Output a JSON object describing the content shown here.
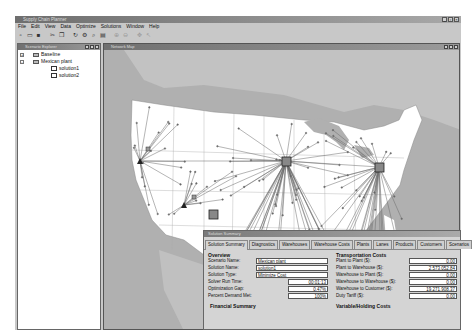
{
  "app": {
    "title": "Supply Chain Planner",
    "window_controls": [
      "minimize",
      "maximize",
      "close"
    ]
  },
  "menu": [
    "File",
    "Edit",
    "View",
    "Data",
    "Optimize",
    "Solutions",
    "Window",
    "Help"
  ],
  "toolbar": {
    "tools": [
      {
        "icon": "new-icon",
        "glyph": "▫"
      },
      {
        "icon": "open-icon",
        "glyph": "▭"
      },
      {
        "icon": "save-icon",
        "glyph": "■"
      },
      {
        "icon": "sep"
      },
      {
        "icon": "cut-icon",
        "glyph": "✂"
      },
      {
        "icon": "copy-icon",
        "glyph": "❐"
      },
      {
        "icon": "sep"
      },
      {
        "icon": "refresh-icon",
        "glyph": "↻"
      },
      {
        "icon": "optimize-icon",
        "glyph": "⚙"
      },
      {
        "icon": "zoom-icon",
        "glyph": "⌕"
      },
      {
        "icon": "report-icon",
        "glyph": "▤"
      },
      {
        "icon": "sep"
      },
      {
        "icon": "zoom-in-icon",
        "glyph": "⊕",
        "dim": true
      },
      {
        "icon": "zoom-out-icon",
        "glyph": "⊖",
        "dim": true
      },
      {
        "icon": "sep"
      },
      {
        "icon": "pan-icon",
        "glyph": "✥",
        "dim": true
      },
      {
        "icon": "select-icon",
        "glyph": "↖",
        "dim": true
      }
    ]
  },
  "tree": {
    "title": "Scenario Explorer",
    "nodes": [
      {
        "label": "Baseline",
        "level": 0,
        "expander": "+",
        "type": "folder"
      },
      {
        "label": "Mexican plant",
        "level": 0,
        "expander": "-",
        "type": "folder"
      },
      {
        "label": "solution1",
        "level": 1,
        "type": "doc"
      },
      {
        "label": "solution2",
        "level": 1,
        "type": "doc"
      }
    ]
  },
  "map": {
    "title": "Network Map",
    "colors": {
      "water": "#b4b4b4",
      "land_other": "#c4c4c4",
      "us": "#ffffff",
      "lines": "#6a6a6a"
    }
  },
  "solution_panel": {
    "title": "Solution Summary",
    "tabs": [
      "Solution Summary",
      "Diagnostics",
      "Warehouses",
      "Warehouse Costs",
      "Plants",
      "Lanes",
      "Products",
      "Customers",
      "Scenarios"
    ],
    "active_tab": "Solution Summary",
    "overview": {
      "title": "Overview",
      "fields": [
        {
          "label": "Scenario Name:",
          "value": "Mexican plant"
        },
        {
          "label": "Solution Name:",
          "value": "solution1"
        },
        {
          "label": "Solution Type:",
          "value": "Minimize Cost"
        },
        {
          "label": "Solver Run Time:",
          "value": "00:01:13"
        },
        {
          "label": "Optimization Gap:",
          "value": "0.47%"
        },
        {
          "label": "Percent Demand Met:",
          "value": "100%"
        }
      ]
    },
    "financial_summary": {
      "title": "Financial Summary"
    },
    "transportation_costs": {
      "title": "Transportation Costs",
      "fields": [
        {
          "label": "Plant to Plant ($):",
          "value": "0.00"
        },
        {
          "label": "Plant to Warehouse ($):",
          "value": "2,573,052.84"
        },
        {
          "label": "Warehouse to Plant ($):",
          "value": "0.00"
        },
        {
          "label": "Warehouse to Warehouse ($):",
          "value": "0.00"
        },
        {
          "label": "Warehouse to Customer ($):",
          "value": "19,271,908.37"
        },
        {
          "label": "Duty Tariff ($):",
          "value": "0.00"
        }
      ]
    },
    "variable_holding_costs": {
      "title": "Variable/Holding Costs"
    }
  }
}
